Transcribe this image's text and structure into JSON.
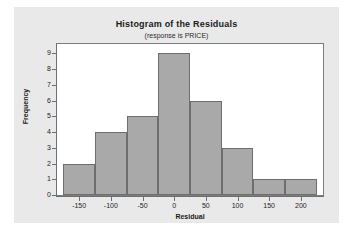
{
  "figure": {
    "background_color": "#e9e9e9",
    "plot_background_color": "#ffffff",
    "frame_color": "#7d7d7d"
  },
  "chart_data": {
    "type": "bar",
    "title": "Histogram of the Residuals",
    "subtitle": "(response is PRICE)",
    "xlabel": "Residual",
    "ylabel": "Frequency",
    "bar_color": "#a9a9a9",
    "bar_edge_color": "#6e6e6e",
    "grid": false,
    "legend": "none",
    "xlim": [
      -185,
      235
    ],
    "ylim": [
      0,
      9.6
    ],
    "xticks": [
      -150,
      -100,
      -50,
      0,
      50,
      100,
      150,
      200
    ],
    "xtick_labels": [
      "-150",
      "-100",
      "-50",
      "0",
      "50",
      "100",
      "150",
      "200"
    ],
    "yticks": [
      0,
      1,
      2,
      3,
      4,
      5,
      6,
      7,
      8,
      9
    ],
    "ytick_labels": [
      "0",
      "1",
      "2",
      "3",
      "4",
      "5",
      "6",
      "7",
      "8",
      "9"
    ],
    "bin_edges": [
      -175,
      -125,
      -75,
      -25,
      25,
      75,
      125,
      175,
      225
    ],
    "bin_centers": [
      -150,
      -100,
      -50,
      0,
      50,
      100,
      150,
      200
    ],
    "categories": [
      "-175 to -125",
      "-125 to -75",
      "-75 to -25",
      "-25 to 25",
      "25 to 75",
      "75 to 125",
      "125 to 175",
      "175 to 225"
    ],
    "values": [
      2,
      4,
      5,
      9,
      6,
      3,
      1,
      1
    ]
  }
}
